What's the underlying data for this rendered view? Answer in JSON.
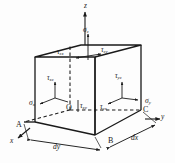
{
  "figure": {
    "type": "engineering-diagram",
    "background_color": "#fdfdfd",
    "line_color": "#1a1a1a"
  },
  "axes": [
    {
      "name": "z-axis",
      "label": "z",
      "direction": "up",
      "x": 85,
      "y": 3
    },
    {
      "name": "x-axis",
      "label": "x",
      "direction": "lower-left",
      "x": 13,
      "y": 140
    },
    {
      "name": "y-axis",
      "label": "y",
      "direction": "right",
      "x": 162,
      "y": 126
    }
  ],
  "vertices": [
    {
      "name": "origin",
      "label": "O",
      "x": 70,
      "y": 110
    },
    {
      "name": "corner-a",
      "label": "A",
      "x": 18,
      "y": 126
    },
    {
      "name": "corner-b",
      "label": "B",
      "x": 111,
      "y": 141
    },
    {
      "name": "corner-c",
      "label": "C",
      "x": 145,
      "y": 113
    }
  ],
  "normal_stresses": [
    {
      "name": "sigma-z",
      "symbol": "σ",
      "subscript": "z",
      "face": "top",
      "x": 83,
      "y": 30
    },
    {
      "name": "sigma-x",
      "symbol": "σ",
      "subscript": "x",
      "face": "left",
      "x": 32,
      "y": 103
    },
    {
      "name": "sigma-y",
      "symbol": "σ",
      "subscript": "y",
      "face": "right",
      "x": 147,
      "y": 101
    }
  ],
  "shear_stresses": [
    {
      "name": "tau-zx",
      "symbol": "τ",
      "subscript": "zx",
      "face": "top",
      "x": 62,
      "y": 52
    },
    {
      "name": "tau-zy",
      "symbol": "τ",
      "subscript": "zy",
      "face": "top",
      "x": 101,
      "y": 50
    },
    {
      "name": "tau-xz",
      "symbol": "τ",
      "subscript": "xz",
      "face": "left",
      "x": 50,
      "y": 79
    },
    {
      "name": "tau-yz",
      "symbol": "τ",
      "subscript": "yz",
      "face": "right",
      "x": 118,
      "y": 76
    },
    {
      "name": "tau-xy",
      "symbol": "τ",
      "subscript": "xy",
      "face": "front",
      "x": 83,
      "y": 106
    },
    {
      "name": "tau-yx",
      "symbol": "τ",
      "subscript": "yx",
      "face": "front",
      "x": 103,
      "y": 108
    }
  ],
  "dimensions": [
    {
      "name": "dimension-dy",
      "label": "dy",
      "span": "A-to-B",
      "x": 56,
      "y": 146
    },
    {
      "name": "dimension-dx",
      "label": "dx",
      "span": "B-to-C",
      "x": 134,
      "y": 138
    }
  ]
}
